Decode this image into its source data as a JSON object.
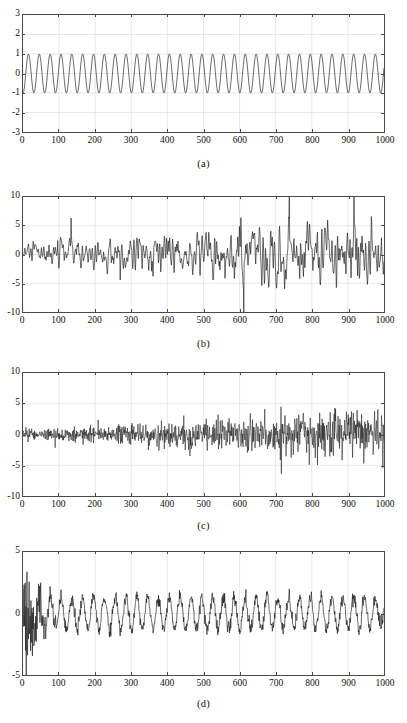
{
  "figure": {
    "type": "multi-panel-timeseries",
    "panel_count": 4,
    "background_color": "#ffffff",
    "trace_color": "#1a1a1a",
    "grid_color": "#d9d9d9",
    "axis_color": "#4a4a4a"
  },
  "chart_data": [
    {
      "type": "line",
      "panel": "a",
      "caption": "(a)",
      "title": "",
      "xlabel": "",
      "ylabel": "",
      "xlim": [
        0,
        1000
      ],
      "ylim": [
        -3,
        3
      ],
      "xticks": [
        0,
        100,
        200,
        300,
        400,
        500,
        600,
        700,
        800,
        900,
        1000
      ],
      "xticklabels": [
        "0",
        "100",
        "200",
        "300",
        "400",
        "500",
        "600",
        "700",
        "800",
        "900",
        "1000"
      ],
      "yticks": [
        -3,
        -2,
        -1,
        0,
        1,
        2,
        3
      ],
      "yticklabels": [
        "-3",
        "-2",
        "-1",
        "0",
        "1",
        "2",
        "3"
      ],
      "grid": true,
      "description": "Clean sinusoid, amplitude 1, period approximately 30 samples",
      "series": [
        {
          "name": "clean sine",
          "generator": "sine",
          "amplitude": 1.0,
          "period": 30,
          "phase": -1.6,
          "offset": 0.0,
          "n": 1000
        }
      ]
    },
    {
      "type": "line",
      "panel": "b",
      "caption": "(b)",
      "title": "",
      "xlabel": "",
      "ylabel": "",
      "xlim": [
        0,
        1000
      ],
      "ylim": [
        -10,
        10
      ],
      "xticks": [
        0,
        100,
        200,
        300,
        400,
        500,
        600,
        700,
        800,
        900,
        1000
      ],
      "xticklabels": [
        "0",
        "100",
        "200",
        "300",
        "400",
        "500",
        "600",
        "700",
        "800",
        "900",
        "1000"
      ],
      "yticks": [
        -10,
        -5,
        0,
        5,
        10
      ],
      "yticklabels": [
        "-10",
        "-5",
        "0",
        "5",
        "10"
      ],
      "grid": true,
      "description": "Noisy signal with amplitude growing from about 1 at the left to about 7 near the right edge",
      "series": [
        {
          "name": "noisy signal",
          "generator": "growing-noise",
          "seed": 12345,
          "envelope_start": 1.0,
          "envelope_end": 3.2,
          "smoothing": 2,
          "n": 1000
        }
      ]
    },
    {
      "type": "line",
      "panel": "c",
      "caption": "(c)",
      "title": "",
      "xlabel": "",
      "ylabel": "",
      "xlim": [
        0,
        1000
      ],
      "ylim": [
        -10,
        10
      ],
      "xticks": [
        0,
        100,
        200,
        300,
        400,
        500,
        600,
        700,
        800,
        900,
        1000
      ],
      "xticklabels": [
        "0",
        "100",
        "200",
        "300",
        "400",
        "500",
        "600",
        "700",
        "800",
        "900",
        "1000"
      ],
      "yticks": [
        -10,
        -5,
        0,
        5,
        10
      ],
      "yticklabels": [
        "-10",
        "-5",
        "0",
        "5",
        "10"
      ],
      "grid": true,
      "description": "Dense high-frequency noise, amplitude growing from about 0.5 to about 4, with occasional spikes up to 9 and down to -8",
      "series": [
        {
          "name": "high-frequency noise",
          "generator": "growing-noise",
          "seed": 777,
          "envelope_start": 0.45,
          "envelope_end": 2.1,
          "smoothing": 0,
          "n": 1000
        }
      ]
    },
    {
      "type": "line",
      "panel": "d",
      "caption": "(d)",
      "title": "",
      "xlabel": "",
      "ylabel": "",
      "xlim": [
        0,
        1000
      ],
      "ylim": [
        -5,
        5
      ],
      "xticks": [
        0,
        100,
        200,
        300,
        400,
        500,
        600,
        700,
        800,
        900,
        1000
      ],
      "xticklabels": [
        "0",
        "100",
        "200",
        "300",
        "400",
        "500",
        "600",
        "700",
        "800",
        "900",
        "1000"
      ],
      "yticks": [
        -5,
        0,
        5
      ],
      "yticklabels": [
        "-5",
        "0",
        "5"
      ],
      "grid": true,
      "description": "Recovered periodic signal: strong transient noise for the first 120 samples reaching +5 and -4, then a settled oscillation of amplitude about 1.3 and period about 30",
      "series": [
        {
          "name": "recovered signal",
          "generator": "transient-then-sine",
          "seed": 2024,
          "transient_end": 120,
          "transient_amplitude": 2.2,
          "settled_amplitude": 1.3,
          "period": 30,
          "phase": -1.6,
          "residual_noise": 0.28,
          "n": 1000
        }
      ]
    }
  ],
  "panels": [
    {
      "caption": "(a)"
    },
    {
      "caption": "(b)"
    },
    {
      "caption": "(c)"
    },
    {
      "caption": "(d)"
    }
  ]
}
